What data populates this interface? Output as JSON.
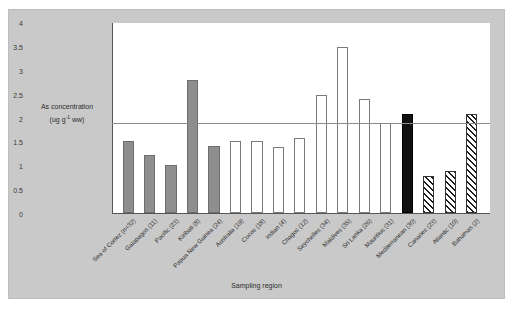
{
  "page": {
    "header_artifact": ""
  },
  "chart_data": {
    "type": "bar",
    "title": "",
    "xlabel": "Sampling region",
    "ylabel": "As concentration (ug g⁻¹ ww)",
    "ylabel_line1": "As concentration",
    "ylabel_line2_prefix": "(ug g",
    "ylabel_line2_sup": "-1",
    "ylabel_line2_suffix": " ww)",
    "ylim": [
      0,
      4
    ],
    "yticks": [
      0,
      0.5,
      1,
      1.5,
      2,
      2.5,
      3,
      3.5,
      4
    ],
    "ytick_labels": [
      "0",
      "0.5",
      "1",
      "1.5",
      "2",
      "2.5",
      "3",
      "3.5",
      "4"
    ],
    "grid": false,
    "legend": "none",
    "reference_line": {
      "value": 1.9,
      "label": ""
    },
    "categories": [
      "Sea of Cortez (n=32)",
      "Galapagos (11)",
      "Pacific (23)",
      "Kiribati (8)",
      "Papua New Guinea (24)",
      "Australia (19)",
      "Cocos (18)",
      "Indian (4)",
      "Chagos (12)",
      "Seychelles (34)",
      "Maldives (35)",
      "Sri Lanka (26)",
      "Mauritius (31)",
      "Mediterranean (30)",
      "Canaries (23)",
      "Atlantic (10)",
      "Bahamas (2)"
    ],
    "values": [
      1.5,
      1.21,
      1.01,
      2.78,
      1.4,
      1.5,
      1.5,
      1.39,
      1.58,
      2.47,
      3.47,
      2.38,
      1.89,
      2.08,
      0.78,
      0.88,
      2.08
    ],
    "fills": [
      "grey",
      "grey",
      "grey",
      "grey",
      "grey",
      "open",
      "open",
      "open",
      "open",
      "open",
      "open",
      "open",
      "open",
      "black",
      "hatch",
      "hatch",
      "hatch"
    ],
    "colors": {
      "grey_bar": "#8e8e8e",
      "open_bar": "#ffffff",
      "black_bar": "#111111",
      "hatch_bar": "#1d1d1d",
      "figure_background": "#c9c9c9",
      "plot_background": "#ffffff",
      "axis": "#555555",
      "reference_line": "#8a8a8a"
    }
  }
}
